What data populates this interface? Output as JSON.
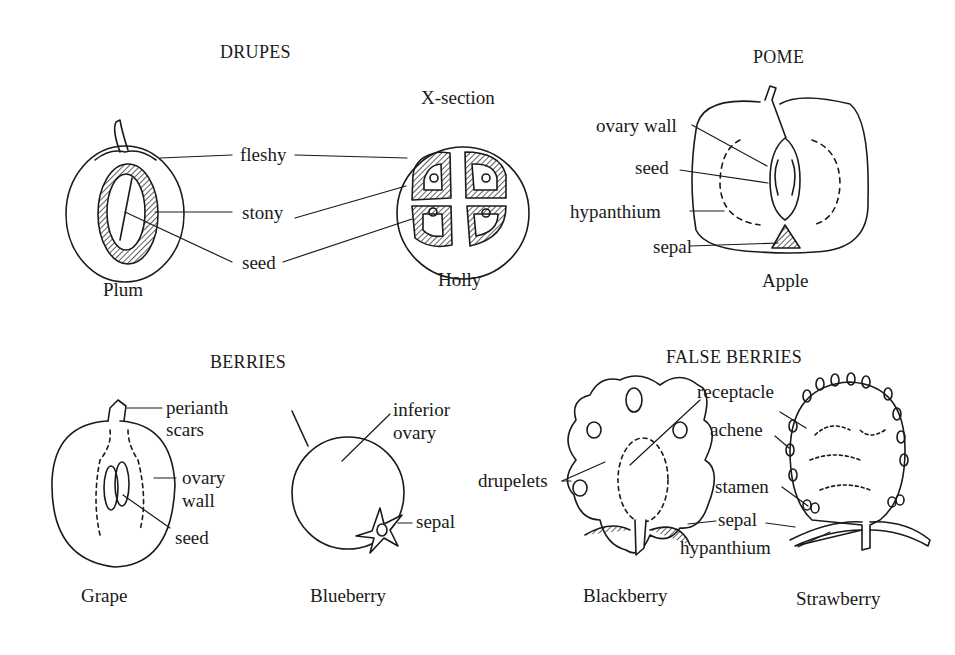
{
  "sections": {
    "drupes": {
      "title": "DRUPES",
      "subtitle": "X-section",
      "labels": [
        "fleshy",
        "stony",
        "seed"
      ],
      "specimens": [
        "Plum",
        "Holly"
      ]
    },
    "pome": {
      "title": "POME",
      "labels": [
        "ovary wall",
        "seed",
        "hypanthium",
        "sepal"
      ],
      "specimens": [
        "Apple"
      ]
    },
    "berries": {
      "title": "BERRIES",
      "grape_labels": [
        "perianth",
        "scars",
        "ovary",
        "wall",
        "seed"
      ],
      "blueberry_labels": [
        "inferior",
        "ovary",
        "sepal"
      ],
      "specimens": [
        "Grape",
        "Blueberry"
      ]
    },
    "false_berries": {
      "title": "FALSE BERRIES",
      "blackberry_labels": [
        "drupelets",
        "receptacle"
      ],
      "strawberry_labels": [
        "achene",
        "stamen",
        "sepal",
        "hypanthium"
      ],
      "specimens": [
        "Blackberry",
        "Strawberry"
      ]
    }
  },
  "colors": {
    "ink": "#1a1a1a",
    "background": "#ffffff"
  }
}
